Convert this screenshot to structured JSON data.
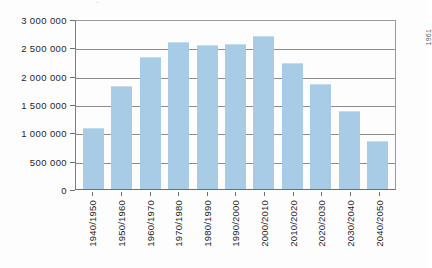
{
  "chart_data": {
    "type": "bar",
    "title": "",
    "subtitle": "",
    "xlabel": "",
    "ylabel": "",
    "categories": [
      "1940/1950",
      "1950/1960",
      "1960/1970",
      "1970/1980",
      "1980/1990",
      "1990/2000",
      "2000/2010",
      "2010/2020",
      "2020/2030",
      "2030/2040",
      "2040/2050"
    ],
    "values": [
      1060000,
      1800000,
      2320000,
      2580000,
      2530000,
      2550000,
      2680000,
      2200000,
      1830000,
      1360000,
      830000
    ],
    "ylim": [
      0,
      3000000
    ],
    "ytick_values": [
      0,
      500000,
      1000000,
      1500000,
      2000000,
      2500000,
      3000000
    ],
    "ytick_labels": [
      "0",
      "500 000",
      "1 000 000",
      "1 500 000",
      "2 000 000",
      "2 500 000",
      "3 000 000"
    ],
    "grid": true,
    "grid_axis": "y",
    "legend": false,
    "legend_position": "none",
    "bar_color": "#a9cce6",
    "grid_color": "#8c8c8c",
    "axis_color": "#6e6e6e",
    "text_color": "#1f1f1f"
  },
  "annotations": {
    "side_note": "1961",
    "top_mark": "·"
  }
}
